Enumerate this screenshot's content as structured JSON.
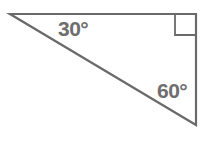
{
  "figure": {
    "type": "right-triangle",
    "stroke_color": "#6a6a6a",
    "text_color": "#6e6e6e",
    "vertices": {
      "top_left": [
        10,
        14
      ],
      "top_right": [
        196,
        14
      ],
      "bottom_right": [
        196,
        125
      ]
    },
    "right_angle_marker": {
      "corner": "top_right",
      "size": 21
    },
    "angles": [
      {
        "label": "30°",
        "vertex": "top_left"
      },
      {
        "label": "60°",
        "vertex": "bottom_right"
      }
    ]
  }
}
